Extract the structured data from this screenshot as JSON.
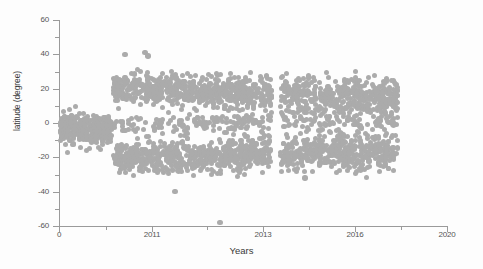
{
  "chart_data": {
    "type": "scatter",
    "title": "",
    "xlabel": "Years",
    "ylabel": "latitude (degree)",
    "xlim": [
      0,
      2020
    ],
    "ylim": [
      -60,
      60
    ],
    "grid": false,
    "legend": null,
    "marker": {
      "shape": "circle",
      "color": "#ababab",
      "size_px": 5,
      "opacity": 1.0
    },
    "xticks": [
      {
        "label": "0",
        "value": 0,
        "type": "major"
      },
      {
        "label": "",
        "value": 1005,
        "type": "minor"
      },
      {
        "label": "2011",
        "value": 2011,
        "type": "major"
      },
      {
        "label": "",
        "value": 2012,
        "type": "minor"
      },
      {
        "label": "2013",
        "value": 2013,
        "type": "major"
      },
      {
        "label": "",
        "value": 2014.5,
        "type": "minor"
      },
      {
        "label": "2016",
        "value": 2016,
        "type": "major"
      },
      {
        "label": "",
        "value": 2018,
        "type": "minor"
      },
      {
        "label": "2020",
        "value": 2020,
        "type": "major"
      }
    ],
    "yticks": [
      {
        "label": "60",
        "value": 60,
        "type": "major"
      },
      {
        "label": "",
        "value": 50,
        "type": "minor"
      },
      {
        "label": "40",
        "value": 40,
        "type": "major"
      },
      {
        "label": "",
        "value": 30,
        "type": "minor"
      },
      {
        "label": "20",
        "value": 20,
        "type": "major"
      },
      {
        "label": "",
        "value": 10,
        "type": "minor"
      },
      {
        "label": "0",
        "value": 0,
        "type": "major"
      },
      {
        "label": "",
        "value": -10,
        "type": "minor"
      },
      {
        "label": "-20",
        "value": -20,
        "type": "major"
      },
      {
        "label": "",
        "value": -30,
        "type": "minor"
      },
      {
        "label": "-40",
        "value": -40,
        "type": "major"
      },
      {
        "label": "",
        "value": -50,
        "type": "minor"
      },
      {
        "label": "-60",
        "value": -60,
        "type": "major"
      }
    ],
    "series": [
      {
        "name": "events",
        "n_points_rendered": 1120,
        "clusters": [
          {
            "name": "early-equatorial",
            "x_px_range": [
              60,
              112
            ],
            "lat_center": -4,
            "lat_spread": 11,
            "density": 130
          },
          {
            "name": "northern-band",
            "x_px_range": [
              113,
              398
            ],
            "lat_center": 17,
            "lat_spread": 9,
            "density": 430
          },
          {
            "name": "southern-band",
            "x_px_range": [
              113,
              398
            ],
            "lat_center": -18,
            "lat_spread": 9,
            "density": 430
          },
          {
            "name": "equatorial-lane",
            "x_px_range": [
              113,
              398
            ],
            "lat_center": -1,
            "lat_spread": 5,
            "density": 100
          }
        ],
        "gaps_px": [
          [
            272,
            280
          ]
        ],
        "outliers": [
          {
            "x_px": 125,
            "lat": 40
          },
          {
            "x_px": 145,
            "lat": 41
          },
          {
            "x_px": 148,
            "lat": 39
          },
          {
            "x_px": 175,
            "lat": -40
          },
          {
            "x_px": 220,
            "lat": -58
          },
          {
            "x_px": 305,
            "lat": -32
          },
          {
            "x_px": 358,
            "lat": -22
          },
          {
            "x_px": 280,
            "lat": 31
          }
        ]
      }
    ]
  },
  "geometry": {
    "x_px_at_x0": 59,
    "x_px_at_x2020": 447,
    "y_px_at_60": 20,
    "y_px_at_minus60": 226
  }
}
